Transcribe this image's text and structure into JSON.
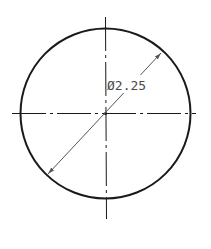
{
  "drawing": {
    "type": "circle-diameter-dimension",
    "dimension_label": "Ø2.25",
    "colors": {
      "background": "#ffffff",
      "outline": "#1a1a1a",
      "centerline": "#1a1a1a",
      "dimension_line": "#555555",
      "text": "#4a4a4a"
    }
  }
}
